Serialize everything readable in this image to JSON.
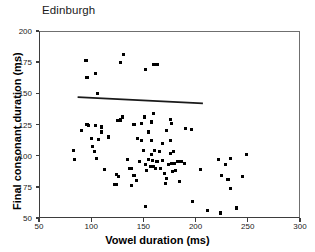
{
  "chart_data": {
    "type": "scatter",
    "title": "Edinburgh",
    "xlabel": "Vowel duration (ms)",
    "ylabel": "Final consonant duration (ms)",
    "xlim": [
      50,
      300
    ],
    "ylim": [
      50,
      200
    ],
    "xticks": [
      50,
      100,
      150,
      200,
      250,
      300
    ],
    "yticks": [
      50,
      75,
      100,
      125,
      150,
      175,
      200
    ],
    "grid": false,
    "legend": null,
    "marker": {
      "shape": "square",
      "color": "#000000",
      "size_px": 3
    },
    "trendline": {
      "type": "linear-regression",
      "color": "#1a1a1a",
      "x_start": 87,
      "y_start": 147,
      "x_end": 207,
      "y_end": 142
    },
    "points": [
      [
        95,
        176
      ],
      [
        96,
        163
      ],
      [
        104,
        166
      ],
      [
        128,
        175
      ],
      [
        131,
        181
      ],
      [
        152,
        169
      ],
      [
        160,
        173
      ],
      [
        163,
        173
      ],
      [
        106,
        150
      ],
      [
        91,
        120
      ],
      [
        96,
        125
      ],
      [
        97,
        124
      ],
      [
        104,
        124
      ],
      [
        110,
        123
      ],
      [
        125,
        128
      ],
      [
        128,
        128
      ],
      [
        128,
        129
      ],
      [
        130,
        131
      ],
      [
        141,
        125
      ],
      [
        148,
        126
      ],
      [
        151,
        131
      ],
      [
        158,
        127
      ],
      [
        160,
        134
      ],
      [
        176,
        129
      ],
      [
        177,
        126
      ],
      [
        196,
        121
      ],
      [
        190,
        122
      ],
      [
        100,
        114
      ],
      [
        101,
        107
      ],
      [
        107,
        113
      ],
      [
        110,
        119
      ],
      [
        117,
        115
      ],
      [
        144,
        114
      ],
      [
        148,
        112
      ],
      [
        155,
        119
      ],
      [
        158,
        112
      ],
      [
        168,
        110
      ],
      [
        172,
        120
      ],
      [
        176,
        112
      ],
      [
        83,
        104
      ],
      [
        84,
        97
      ],
      [
        103,
        103
      ],
      [
        105,
        98
      ],
      [
        113,
        89
      ],
      [
        124,
        85
      ],
      [
        126,
        83
      ],
      [
        122,
        77
      ],
      [
        124,
        77
      ],
      [
        135,
        97
      ],
      [
        137,
        90
      ],
      [
        139,
        90
      ],
      [
        139,
        76
      ],
      [
        141,
        84
      ],
      [
        143,
        80
      ],
      [
        146,
        95
      ],
      [
        150,
        104
      ],
      [
        152,
        93
      ],
      [
        153,
        88
      ],
      [
        155,
        97
      ],
      [
        157,
        91
      ],
      [
        158,
        101
      ],
      [
        159,
        96
      ],
      [
        160,
        91
      ],
      [
        161,
        104
      ],
      [
        162,
        90
      ],
      [
        163,
        95
      ],
      [
        165,
        103
      ],
      [
        166,
        90
      ],
      [
        168,
        96
      ],
      [
        170,
        86
      ],
      [
        171,
        78
      ],
      [
        172,
        82
      ],
      [
        174,
        93
      ],
      [
        176,
        102
      ],
      [
        177,
        94
      ],
      [
        178,
        87
      ],
      [
        179,
        103
      ],
      [
        180,
        94
      ],
      [
        181,
        88
      ],
      [
        183,
        95
      ],
      [
        185,
        79
      ],
      [
        186,
        95
      ],
      [
        189,
        94
      ],
      [
        152,
        59
      ],
      [
        197,
        63
      ],
      [
        205,
        89
      ],
      [
        211,
        56
      ],
      [
        222,
        97
      ],
      [
        224,
        54
      ],
      [
        225,
        84
      ],
      [
        229,
        93
      ],
      [
        231,
        81
      ],
      [
        233,
        98
      ],
      [
        233,
        74
      ],
      [
        239,
        58
      ],
      [
        245,
        83
      ],
      [
        249,
        101
      ]
    ]
  }
}
